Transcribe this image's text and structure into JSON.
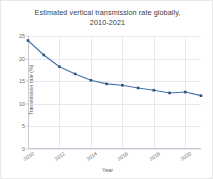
{
  "figure": {
    "background_color": "#ffffff",
    "border_color": "#e8e8e8"
  },
  "title": {
    "line1": "Estimated vertical transmission rate globally,",
    "line2": "2010-2021"
  },
  "axis_titles": {
    "x": "Year",
    "y": "Transmission rate (%)"
  },
  "chart_data": {
    "type": "line",
    "title": "Estimated vertical transmission rate globally, 2010-2021",
    "xlabel": "Year",
    "ylabel": "Transmission rate (%)",
    "x": [
      2010,
      2011,
      2012,
      2013,
      2014,
      2015,
      2016,
      2017,
      2018,
      2019,
      2020,
      2021
    ],
    "values": [
      24.0,
      20.8,
      18.2,
      16.6,
      15.2,
      14.4,
      14.1,
      13.5,
      13.0,
      12.4,
      12.6,
      11.8
    ],
    "series": [
      {
        "name": "Transmission rate",
        "values": [
          24.0,
          20.8,
          18.2,
          16.6,
          15.2,
          14.4,
          14.1,
          13.5,
          13.0,
          12.4,
          12.6,
          11.8
        ],
        "line_color": "#4472a8",
        "marker_color": "#2e5580",
        "marker": "square"
      }
    ],
    "xlim": [
      2010,
      2021
    ],
    "ylim": [
      0,
      25
    ],
    "ytick_values": [
      0,
      5,
      10,
      15,
      20,
      25
    ],
    "ytick_labels": [
      "0",
      "5",
      "10",
      "15",
      "20",
      "25"
    ],
    "xtick_values": [
      2010,
      2012,
      2014,
      2016,
      2018,
      2020
    ],
    "xtick_labels": [
      "2010",
      "2012",
      "2014",
      "2016",
      "2018",
      "2020"
    ],
    "grid": true,
    "grid_color": "#e6e9ef",
    "legend": false,
    "legend_position": "none"
  }
}
